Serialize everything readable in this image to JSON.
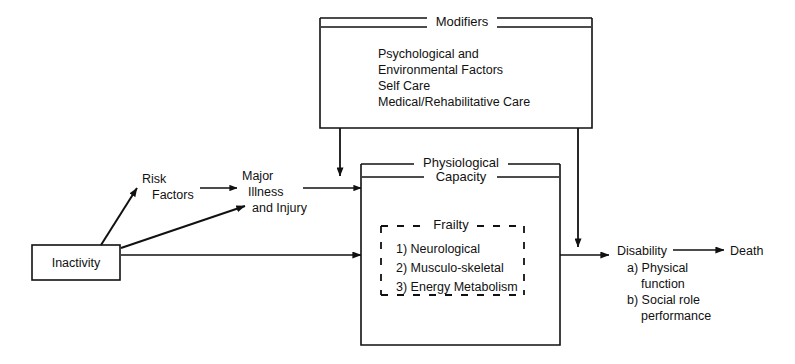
{
  "diagram": {
    "title_hidden": "Pathway from Inactivity to Disability and Death",
    "nodes": {
      "inactivity": {
        "label": "Inactivity"
      },
      "risk_factors": {
        "line1": "Risk",
        "line2": "Factors"
      },
      "major_illness": {
        "line1": "Major",
        "line2": "Illness",
        "line3": "and Injury"
      },
      "modifiers": {
        "title": "Modifiers",
        "items": [
          "Psychological and",
          " Environmental Factors",
          "Self Care",
          "Medical/Rehabilitative Care"
        ]
      },
      "physiological_capacity": {
        "title_line1": "Physiological",
        "title_line2": "Capacity"
      },
      "frailty": {
        "title": "Frailty",
        "items": [
          "1) Neurological",
          "2) Musculo-skeletal",
          "3) Energy Metabolism"
        ]
      },
      "disability": {
        "title": "Disability",
        "item_a_line1": "a)  Physical",
        "item_a_line2": "function",
        "item_b_line1": "b) Social role",
        "item_b_line2": "performance"
      },
      "death": {
        "label": "Death"
      }
    },
    "edges": [
      {
        "name": "inactivity-to-risk-factors"
      },
      {
        "name": "inactivity-to-major-illness"
      },
      {
        "name": "inactivity-to-physiological-capacity"
      },
      {
        "name": "risk-factors-to-major-illness"
      },
      {
        "name": "major-illness-to-physiological-capacity"
      },
      {
        "name": "modifiers-to-physiological-capacity"
      },
      {
        "name": "modifiers-to-disability"
      },
      {
        "name": "physiological-capacity-to-disability"
      },
      {
        "name": "disability-to-death"
      }
    ],
    "colors": {
      "ink": "#111111",
      "background": "#ffffff"
    }
  }
}
